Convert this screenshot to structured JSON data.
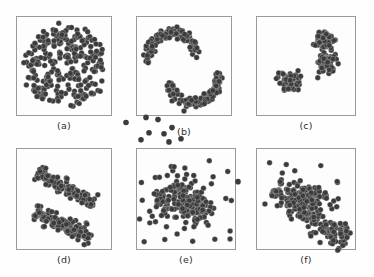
{
  "figure": {
    "background_color": "#fefefe",
    "panel_border_color": "#9a9a9a",
    "point_color": "#3b3b3b",
    "point_radius_px": 2.8,
    "rows": 2,
    "columns": 3
  },
  "panels": [
    {
      "id": "a",
      "label": "(a)",
      "shape": "concentric-rings-spiral",
      "frame": {
        "x": 16,
        "y": 16,
        "w": 96,
        "h": 100
      },
      "label_pos": {
        "x": 16,
        "y": 120,
        "w": 96
      }
    },
    {
      "id": "b",
      "label": "(b)",
      "shape": "two-moons",
      "frame": {
        "x": 136,
        "y": 16,
        "w": 96,
        "h": 100
      },
      "label_pos": {
        "x": 136,
        "y": 126,
        "w": 96
      }
    },
    {
      "id": "c",
      "label": "(c)",
      "shape": "separated-blobs",
      "frame": {
        "x": 256,
        "y": 16,
        "w": 100,
        "h": 100
      },
      "label_pos": {
        "x": 256,
        "y": 120,
        "w": 100
      }
    },
    {
      "id": "d",
      "label": "(d)",
      "shape": "two-elongated-diagonal-clusters",
      "frame": {
        "x": 16,
        "y": 148,
        "w": 96,
        "h": 102
      },
      "label_pos": {
        "x": 16,
        "y": 254,
        "w": 96
      }
    },
    {
      "id": "e",
      "label": "(e)",
      "shape": "dense-cluster-with-noise",
      "frame": {
        "x": 136,
        "y": 148,
        "w": 100,
        "h": 102
      },
      "label_pos": {
        "x": 136,
        "y": 254,
        "w": 100
      }
    },
    {
      "id": "f",
      "label": "(f)",
      "shape": "elongated-diagonal-cluster-with-noise",
      "frame": {
        "x": 256,
        "y": 148,
        "w": 100,
        "h": 102
      },
      "label_pos": {
        "x": 256,
        "y": 254,
        "w": 100
      }
    }
  ],
  "chart_data": [
    {
      "type": "scatter",
      "panel": "a",
      "title": "(a)",
      "xlabel": "",
      "ylabel": "",
      "xlim": [
        0,
        100
      ],
      "ylim": [
        0,
        100
      ],
      "grid": false,
      "legend": null,
      "description": "Dense set of concentric circular rings (spiral / ring clusters) centred in the panel with a small empty core.",
      "generator": {
        "kind": "rings",
        "center": [
          50,
          50
        ],
        "rings": [
          {
            "radius": 12,
            "n": 36,
            "jitter": 3.0
          },
          {
            "radius": 22,
            "n": 58,
            "jitter": 3.4
          },
          {
            "radius": 31,
            "n": 78,
            "jitter": 3.6
          },
          {
            "radius": 39,
            "n": 92,
            "jitter": 3.6
          }
        ]
      }
    },
    {
      "type": "scatter",
      "panel": "b",
      "title": "(b)",
      "xlabel": "",
      "ylabel": "",
      "xlim": [
        0,
        100
      ],
      "ylim": [
        0,
        100
      ],
      "grid": false,
      "legend": null,
      "description": "Two interlocking crescent (half-moon) shaped clusters, plus one isolated point below the lower moon.",
      "generator": {
        "kind": "moons",
        "moons": [
          {
            "center": [
              38,
              42
            ],
            "radius": 26,
            "angle_start": 170,
            "angle_end": 350,
            "n": 120,
            "jitter": 4.0
          },
          {
            "center": [
              60,
              62
            ],
            "radius": 26,
            "angle_start": -10,
            "angle_end": 170,
            "n": 120,
            "jitter": 4.0
          }
        ],
        "outliers": [
          [
            50,
            96
          ]
        ]
      }
    },
    {
      "type": "scatter",
      "panel": "c",
      "title": "(c)",
      "xlabel": "",
      "ylabel": "",
      "xlim": [
        0,
        100
      ],
      "ylim": [
        0,
        100
      ],
      "grid": false,
      "legend": null,
      "description": "Three compact well-separated globular blobs: one lower-left, two stacked upper-right.",
      "generator": {
        "kind": "blobs",
        "blobs": [
          {
            "center": [
              33,
              66
            ],
            "sx": 9,
            "sy": 8,
            "n": 95
          },
          {
            "center": [
              68,
              24
            ],
            "sx": 8,
            "sy": 8,
            "n": 80
          },
          {
            "center": [
              72,
              46
            ],
            "sx": 8,
            "sy": 8,
            "n": 80
          }
        ],
        "outliers": [
          [
            62,
            62
          ]
        ]
      }
    },
    {
      "type": "scatter",
      "panel": "d",
      "title": "(d)",
      "xlabel": "",
      "ylabel": "",
      "xlim": [
        0,
        100
      ],
      "ylim": [
        0,
        100
      ],
      "grid": false,
      "legend": null,
      "description": "Two parallel elongated clusters running from upper-left to lower-right, separated by a clear gap.",
      "generator": {
        "kind": "elongated",
        "bands": [
          {
            "p0": [
              22,
              24
            ],
            "p1": [
              82,
              56
            ],
            "n": 130,
            "thickness": 9
          },
          {
            "p0": [
              18,
              62
            ],
            "p1": [
              78,
              90
            ],
            "n": 130,
            "thickness": 9
          }
        ],
        "outliers": [
          [
            47,
            37
          ]
        ]
      }
    },
    {
      "type": "scatter",
      "panel": "e",
      "title": "(e)",
      "xlabel": "",
      "ylabel": "",
      "xlim": [
        0,
        100
      ],
      "ylim": [
        0,
        100
      ],
      "grid": false,
      "legend": null,
      "description": "One very dense irregular cluster in the centre-right with a diffuse halo and many sparse noise points, some falling outside the panel frame above it.",
      "generator": {
        "kind": "dense-plus-noise",
        "core": {
          "center": [
            58,
            58
          ],
          "sx": 14,
          "sy": 14,
          "n": 150
        },
        "halo": {
          "center": [
            36,
            48
          ],
          "sx": 16,
          "sy": 15,
          "n": 90
        },
        "noise_n": 40,
        "outside_points": [
          [
            -10,
            -25
          ],
          [
            10,
            -30
          ],
          [
            22,
            -28
          ],
          [
            13,
            -15
          ],
          [
            28,
            -14
          ],
          [
            36,
            -20
          ],
          [
            5,
            -8
          ],
          [
            33,
            -6
          ],
          [
            45,
            -9
          ]
        ]
      }
    },
    {
      "type": "scatter",
      "panel": "f",
      "title": "(f)",
      "xlabel": "",
      "ylabel": "",
      "xlim": [
        0,
        100
      ],
      "ylim": [
        0,
        100
      ],
      "grid": false,
      "legend": null,
      "description": "A broad elongated cluster running diagonally from upper-left to lower-right, densest in the middle, with scattered noise points and one isolated point left of the frame.",
      "generator": {
        "kind": "diagonal-dense",
        "band": {
          "p0": [
            18,
            40
          ],
          "p1": [
            92,
            92
          ],
          "n": 200,
          "thickness": 16
        },
        "core": {
          "center": [
            52,
            48
          ],
          "sx": 15,
          "sy": 11,
          "n": 90
        },
        "noise_n": 18,
        "outside_points": [
          [
            -18,
            33
          ]
        ]
      }
    }
  ]
}
